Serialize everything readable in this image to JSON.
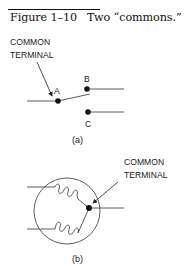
{
  "figure": {
    "label": "Figure 1–10",
    "title": "Two “commons.”"
  },
  "diagram_a": {
    "callout_line1": "COMMON",
    "callout_line2": "TERMINAL",
    "terminals": [
      "A",
      "B",
      "C"
    ],
    "sublabel": "(a)"
  },
  "diagram_b": {
    "callout_line1": "COMMON",
    "callout_line2": "TERMINAL",
    "sublabel": "(b)"
  }
}
